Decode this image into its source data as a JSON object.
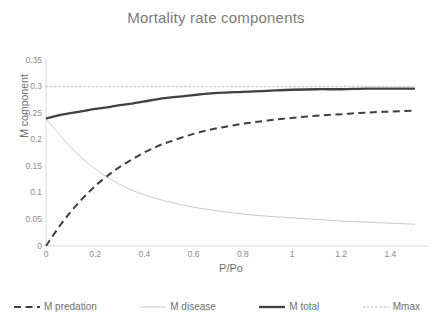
{
  "chart_data": {
    "type": "line",
    "title": "Mortality rate components",
    "xlabel": "P/Po",
    "ylabel": "M component",
    "xlim": [
      0,
      1.5
    ],
    "ylim": [
      0,
      0.35
    ],
    "grid": false,
    "legend_position": "bottom",
    "xticks": [
      "0",
      "0.2",
      "0.4",
      "0.6",
      "0.8",
      "1",
      "1.2",
      "1.4"
    ],
    "xtick_values": [
      0,
      0.2,
      0.4,
      0.6,
      0.8,
      1.0,
      1.2,
      1.4
    ],
    "yticks": [
      "0",
      "0.05",
      "0.1",
      "0.15",
      "0.2",
      "0.25",
      "0.3",
      "0.35"
    ],
    "ytick_values": [
      0,
      0.05,
      0.1,
      0.15,
      0.2,
      0.25,
      0.3,
      0.35
    ],
    "x": [
      0,
      0.05,
      0.1,
      0.15,
      0.2,
      0.25,
      0.3,
      0.35,
      0.4,
      0.45,
      0.5,
      0.6,
      0.7,
      0.8,
      0.9,
      1.0,
      1.1,
      1.2,
      1.3,
      1.4,
      1.5
    ],
    "series": [
      {
        "name": "M predation",
        "style": "dashed",
        "color": "#3f3f3f",
        "width": 2.0,
        "values": [
          0,
          0.034,
          0.064,
          0.09,
          0.113,
          0.132,
          0.149,
          0.163,
          0.176,
          0.187,
          0.196,
          0.211,
          0.222,
          0.23,
          0.236,
          0.241,
          0.245,
          0.248,
          0.251,
          0.253,
          0.255
        ]
      },
      {
        "name": "M disease",
        "style": "solid-thin",
        "color": "#c2c2c2",
        "width": 0.9,
        "values": [
          0.24,
          0.212,
          0.186,
          0.164,
          0.145,
          0.129,
          0.116,
          0.105,
          0.096,
          0.089,
          0.083,
          0.073,
          0.066,
          0.06,
          0.056,
          0.053,
          0.05,
          0.047,
          0.045,
          0.043,
          0.041
        ]
      },
      {
        "name": "M total",
        "style": "solid-thick",
        "color": "#404040",
        "width": 2.3,
        "values": [
          0.24,
          0.246,
          0.25,
          0.254,
          0.258,
          0.261,
          0.265,
          0.268,
          0.272,
          0.276,
          0.279,
          0.284,
          0.288,
          0.29,
          0.292,
          0.294,
          0.295,
          0.295,
          0.296,
          0.296,
          0.296
        ]
      },
      {
        "name": "Mmax",
        "style": "dotted",
        "color": "#cfcfcf",
        "width": 1.4,
        "values": [
          0.3,
          0.3,
          0.3,
          0.3,
          0.3,
          0.3,
          0.3,
          0.3,
          0.3,
          0.3,
          0.3,
          0.3,
          0.3,
          0.3,
          0.3,
          0.3,
          0.3,
          0.3,
          0.3,
          0.3,
          0.3
        ]
      }
    ],
    "legend": [
      {
        "label": "M predation",
        "style": "dashed",
        "color": "#3f3f3f"
      },
      {
        "label": "M disease",
        "style": "solid-thin",
        "color": "#c2c2c2"
      },
      {
        "label": "M total",
        "style": "solid-thick",
        "color": "#404040"
      },
      {
        "label": "Mmax",
        "style": "dotted",
        "color": "#cfcfcf"
      }
    ],
    "axis_color": "#d9d9d9",
    "text_color": "#7b7b7b"
  }
}
